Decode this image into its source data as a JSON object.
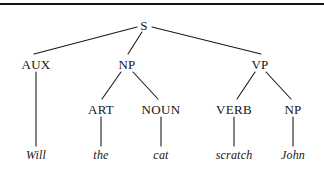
{
  "figure": {
    "kind": "syntax-parse-tree",
    "sentence": "Will the cat scratch John",
    "line_color": "#1a1a1a",
    "text_color": "#151515",
    "background_color": "#ffffff",
    "rule_color": "#111111"
  },
  "nodes": [
    {
      "id": "s",
      "label": "S",
      "x": 144,
      "y": 25,
      "style": "cat"
    },
    {
      "id": "aux",
      "label": "AUX",
      "x": 36,
      "y": 64,
      "style": "cat"
    },
    {
      "id": "np1",
      "label": "NP",
      "x": 127,
      "y": 64,
      "style": "cat"
    },
    {
      "id": "vp",
      "label": "VP",
      "x": 260,
      "y": 64,
      "style": "cat"
    },
    {
      "id": "art",
      "label": "ART",
      "x": 101,
      "y": 109,
      "style": "cat"
    },
    {
      "id": "noun",
      "label": "NOUN",
      "x": 161,
      "y": 109,
      "style": "cat"
    },
    {
      "id": "verb",
      "label": "VERB",
      "x": 234,
      "y": 109,
      "style": "cat"
    },
    {
      "id": "np2",
      "label": "NP",
      "x": 293,
      "y": 109,
      "style": "cat"
    },
    {
      "id": "will",
      "label": "Will",
      "x": 36,
      "y": 155,
      "style": "word"
    },
    {
      "id": "the",
      "label": "the",
      "x": 101,
      "y": 155,
      "style": "word"
    },
    {
      "id": "cat",
      "label": "cat",
      "x": 161,
      "y": 155,
      "style": "word"
    },
    {
      "id": "scratch",
      "label": "scratch",
      "x": 234,
      "y": 155,
      "style": "word"
    },
    {
      "id": "john",
      "label": "John",
      "x": 293,
      "y": 155,
      "style": "word"
    }
  ],
  "edges": [
    {
      "id": "s-aux",
      "from": "s",
      "to": "aux",
      "x1": 137,
      "y1": 27,
      "x2": 34,
      "y2": 54
    },
    {
      "id": "s-np1",
      "from": "s",
      "to": "np1",
      "x1": 142,
      "y1": 32,
      "x2": 128,
      "y2": 54
    },
    {
      "id": "s-vp",
      "from": "s",
      "to": "vp",
      "x1": 152,
      "y1": 27,
      "x2": 261,
      "y2": 54
    },
    {
      "id": "aux-will",
      "from": "aux",
      "to": "will",
      "x1": 36,
      "y1": 72,
      "x2": 36,
      "y2": 146
    },
    {
      "id": "np1-art",
      "from": "np1",
      "to": "art",
      "x1": 121,
      "y1": 72,
      "x2": 102,
      "y2": 99
    },
    {
      "id": "np1-noun",
      "from": "np1",
      "to": "noun",
      "x1": 133,
      "y1": 72,
      "x2": 158,
      "y2": 99
    },
    {
      "id": "vp-verb",
      "from": "vp",
      "to": "verb",
      "x1": 255,
      "y1": 72,
      "x2": 237,
      "y2": 99
    },
    {
      "id": "vp-np2",
      "from": "vp",
      "to": "np2",
      "x1": 266,
      "y1": 72,
      "x2": 291,
      "y2": 99
    },
    {
      "id": "art-the",
      "from": "art",
      "to": "the",
      "x1": 101,
      "y1": 117,
      "x2": 101,
      "y2": 146
    },
    {
      "id": "noun-cat",
      "from": "noun",
      "to": "cat",
      "x1": 161,
      "y1": 117,
      "x2": 161,
      "y2": 146
    },
    {
      "id": "verb-scratch",
      "from": "verb",
      "to": "scratch",
      "x1": 234,
      "y1": 117,
      "x2": 234,
      "y2": 146
    },
    {
      "id": "np2-john",
      "from": "np2",
      "to": "john",
      "x1": 293,
      "y1": 117,
      "x2": 293,
      "y2": 146
    }
  ]
}
